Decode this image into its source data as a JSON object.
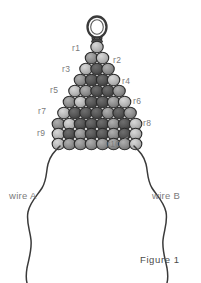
{
  "figure": {
    "caption": "Figure 1",
    "top_note": "",
    "canvas": {
      "width": 201,
      "height": 283,
      "background": "#ffffff"
    }
  },
  "row_labels": [
    {
      "id": "r1",
      "text": "r1",
      "x": 72,
      "y": 43,
      "side": "left"
    },
    {
      "id": "r2",
      "text": "r2",
      "x": 113,
      "y": 55,
      "side": "right"
    },
    {
      "id": "r3",
      "text": "r3",
      "x": 62,
      "y": 64,
      "side": "left"
    },
    {
      "id": "r4",
      "text": "r4",
      "x": 122,
      "y": 76,
      "side": "right"
    },
    {
      "id": "r5",
      "text": "r5",
      "x": 50,
      "y": 85,
      "side": "left"
    },
    {
      "id": "r6",
      "text": "r6",
      "x": 133,
      "y": 96,
      "side": "right"
    },
    {
      "id": "r7",
      "text": "r7",
      "x": 38,
      "y": 106,
      "side": "left"
    },
    {
      "id": "r8",
      "text": "r8",
      "x": 143,
      "y": 118,
      "side": "right"
    },
    {
      "id": "r9",
      "text": "r9",
      "x": 37,
      "y": 128,
      "side": "left"
    },
    {
      "id": "r10",
      "text": "r10",
      "x": 107,
      "y": 139,
      "side": "right"
    }
  ],
  "wires": [
    {
      "id": "wire-a",
      "label": "wire A",
      "x": 9,
      "y": 190
    },
    {
      "id": "wire-b",
      "label": "wire B",
      "x": 152,
      "y": 190
    }
  ],
  "colors": {
    "bead_light": "#b6b6b6",
    "bead_mid": "#8e8e8e",
    "bead_dark": "#555555",
    "bead_outline": "#2b2b2b",
    "wire_stroke": "#3a3a3a",
    "label_text": "#7a7a7a",
    "caption_text": "#4a4a4a"
  },
  "bead_pyramid": {
    "description": "triangular beaded pyramid, 10 rows of seed beads",
    "rows": [
      {
        "row": 1,
        "count": 1,
        "cy": 47,
        "r": 6.2,
        "shades": [
          "light"
        ]
      },
      {
        "row": 2,
        "count": 2,
        "cy": 58,
        "r": 6.2,
        "shades": [
          "mid",
          "light"
        ]
      },
      {
        "row": 3,
        "count": 3,
        "cy": 69,
        "r": 6.2,
        "shades": [
          "light",
          "dark",
          "mid"
        ]
      },
      {
        "row": 4,
        "count": 4,
        "cy": 80,
        "r": 6.2,
        "shades": [
          "mid",
          "dark",
          "dark",
          "light"
        ]
      },
      {
        "row": 5,
        "count": 5,
        "cy": 91,
        "r": 6.2,
        "shades": [
          "light",
          "mid",
          "dark",
          "dark",
          "mid"
        ]
      },
      {
        "row": 6,
        "count": 6,
        "cy": 102,
        "r": 6.2,
        "shades": [
          "mid",
          "light",
          "dark",
          "dark",
          "mid",
          "light"
        ]
      },
      {
        "row": 7,
        "count": 7,
        "cy": 113,
        "r": 6.2,
        "shades": [
          "light",
          "dark",
          "dark",
          "dark",
          "mid",
          "dark",
          "mid"
        ]
      },
      {
        "row": 8,
        "count": 8,
        "cy": 124,
        "r": 6.2,
        "shades": [
          "mid",
          "light",
          "dark",
          "dark",
          "dark",
          "mid",
          "dark",
          "light"
        ]
      },
      {
        "row": 9,
        "count": 8,
        "cy": 134,
        "r": 6.2,
        "shades": [
          "light",
          "dark",
          "mid",
          "dark",
          "dark",
          "mid",
          "dark",
          "light"
        ]
      },
      {
        "row": 10,
        "count": 8,
        "cy": 144,
        "r": 6.2,
        "shades": [
          "light",
          "mid",
          "mid",
          "mid",
          "mid",
          "mid",
          "mid",
          "light"
        ]
      }
    ]
  },
  "loop": {
    "name": "wire-loop",
    "cx": 97,
    "cy": 27,
    "rx": 9,
    "ry": 10
  }
}
